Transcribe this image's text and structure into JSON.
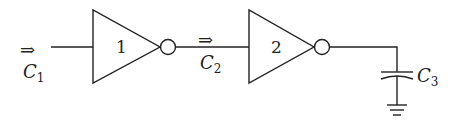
{
  "diagram": {
    "title": "",
    "gates": [
      {
        "id": "inverter-1",
        "label": "1"
      },
      {
        "id": "inverter-2",
        "label": "2"
      }
    ],
    "labels": {
      "c1": "C",
      "c1_sub": "1",
      "c2": "C",
      "c2_sub": "2",
      "c3": "C",
      "c3_sub": "3",
      "arrow": "⇒"
    },
    "colors": {
      "stroke": "#222222",
      "background": "#ffffff"
    }
  }
}
